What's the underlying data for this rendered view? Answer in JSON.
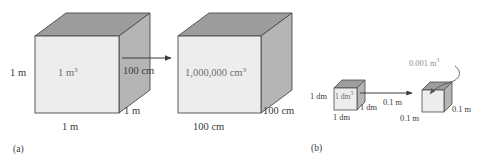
{
  "figure": {
    "background_color": "#ffffff",
    "colors": {
      "cube_front": "#ededed",
      "cube_top": "#9d9d9d",
      "cube_side": "#b5b5b5",
      "outline": "#4a4a4a",
      "text": "#3a3a3a",
      "faint_text": "#8e8e8e",
      "face_label_text": "#6d6d6d",
      "arrow": "#3a3a3a"
    },
    "panels": [
      {
        "tag": "(a)",
        "cubes": [
          {
            "face_label": "1 m",
            "face_label_exp": "3",
            "height_label": "1 m",
            "width_label": "1 m",
            "depth_label": "1 m"
          },
          {
            "face_label": "1,000,000 cm",
            "face_label_exp": "3",
            "height_label": "100 cm",
            "width_label": "100 cm",
            "depth_label": "100 cm"
          }
        ],
        "arrow_label": "100 cm"
      },
      {
        "tag": "(b)",
        "cubes": [
          {
            "face_label": "1 dm",
            "face_label_exp": "3",
            "height_label": "1 dm",
            "width_label": "1 dm",
            "depth_label": "1 dm"
          },
          {
            "callout_label": "0.001 m",
            "callout_label_exp": "3",
            "height_label": "0.1 m",
            "width_label": "0.1 m",
            "depth_label": "0.1 m"
          }
        ],
        "arrow_label": "0.1 m"
      }
    ]
  }
}
